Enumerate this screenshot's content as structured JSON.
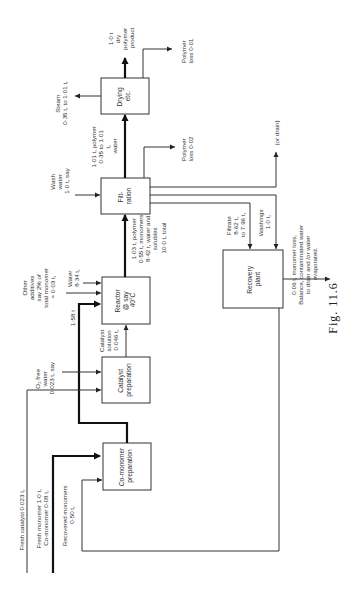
{
  "figure": {
    "caption": "Fig. 11.6",
    "orientation": "rotated-90-ccw"
  },
  "blocks": {
    "drying": [
      "Drying",
      "etc."
    ],
    "filtration": [
      "Filt-",
      "ration"
    ],
    "reactor": [
      "Reactor",
      "@ say",
      "40°C"
    ],
    "catalyst_prep": [
      "Catalyst",
      "preparation"
    ],
    "comonomer_prep": [
      "Co-monomer",
      "preparation"
    ],
    "recovery": [
      "Recovery",
      "plant"
    ]
  },
  "streams": {
    "product": [
      "1·0 t",
      "dry",
      "polymer",
      "product"
    ],
    "polymer_loss_drying": [
      "Polymer",
      "loss 0·01"
    ],
    "steam": [
      "Steam",
      "0·35 t, to 1·01 t,"
    ],
    "filter_cake": [
      "1·01 t, polymer",
      "0·35 to 1·01",
      "t,",
      "water"
    ],
    "wash_water": [
      "Wash",
      "water",
      "1·0 t, say"
    ],
    "polymer_loss_filtration": [
      "Polymer",
      "loss 0·02"
    ],
    "or_drain": "(or drain)",
    "filtrate": [
      "Filtrate",
      "8·62 t,",
      "to 7·96 t,"
    ],
    "washings": [
      "Washings",
      "1·0 t,"
    ],
    "recovery_out": [
      "0·06 t, monomer loss,",
      "Balance, contaminated water",
      "to drain and /or water",
      "evaporated."
    ],
    "reactor_out": [
      "1·03 t, polymer",
      "0·55 t, monomers",
      "8·42 t, water and",
      "solubles",
      "10·0 t, total"
    ],
    "other_additives": [
      "Other",
      "additives",
      "say 2% of",
      "total monomer",
      "= 0·03 t,"
    ],
    "water_reactor": [
      "Water",
      "8·34 t,"
    ],
    "monomer_feed": "1·58 t",
    "catalyst_solution": [
      "Catalyst",
      "solution",
      "0·046 t,"
    ],
    "o2_free_water": [
      "O₂ free",
      "water",
      "0·023 t, say"
    ],
    "fresh_catalyst": "Fresh catalyst 0·023 t,",
    "fresh_monomer": [
      "Fresh monomer 1·0 t,",
      "Co-monomer      0·08 t,"
    ],
    "recovered_monomers": [
      "Recovered monomers",
      "0·50 t,"
    ]
  }
}
